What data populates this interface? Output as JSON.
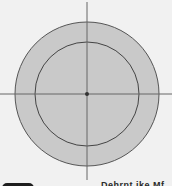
{
  "diagram": {
    "type": "concentric-circles-with-axes",
    "center": {
      "x": 87,
      "y": 94
    },
    "outer_circle": {
      "radius": 72,
      "fill": "#c9c9c9",
      "stroke": "#555555"
    },
    "inner_circle": {
      "radius": 52,
      "fill": "#c9c9c9",
      "stroke": "#444444"
    },
    "axes": {
      "stroke": "#666666"
    },
    "center_point": {
      "radius": 2,
      "fill": "#333333"
    },
    "background": "#f1f1f1"
  },
  "footer": {
    "caption": "Dehrnt ike Mf"
  }
}
